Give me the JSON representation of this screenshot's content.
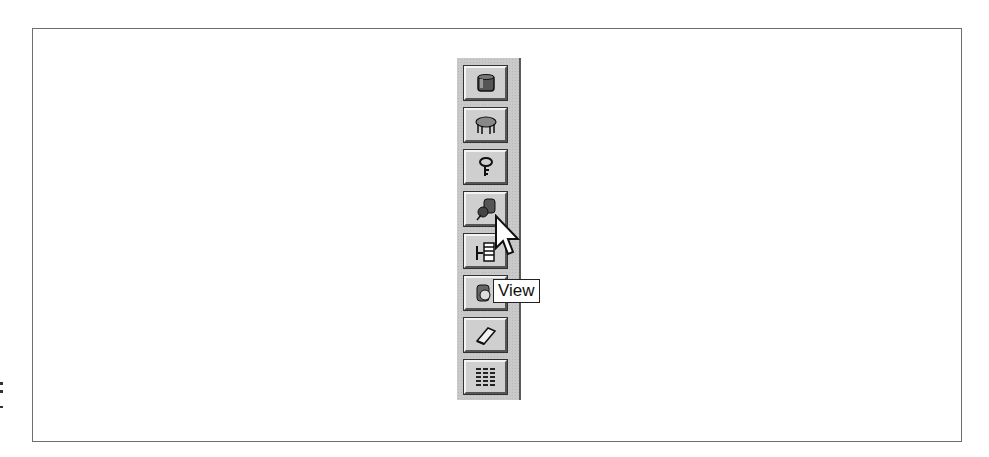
{
  "toolbar": {
    "orientation": "vertical",
    "buttons": [
      {
        "id": "table",
        "icon": "table-cylinder-icon"
      },
      {
        "id": "query",
        "icon": "query-table-icon"
      },
      {
        "id": "key",
        "icon": "key-icon"
      },
      {
        "id": "relation",
        "icon": "relation-database-icon"
      },
      {
        "id": "hierarchy",
        "icon": "hierarchy-icon"
      },
      {
        "id": "view",
        "icon": "view-icon"
      },
      {
        "id": "eraser",
        "icon": "eraser-icon"
      },
      {
        "id": "grid",
        "icon": "grid-icon"
      }
    ]
  },
  "tooltip": {
    "text": "View"
  },
  "colors": {
    "toolbar_bg": "#c9c9c9",
    "frame": "#6e6e6e",
    "tooltip_bg": "#ffffff"
  }
}
